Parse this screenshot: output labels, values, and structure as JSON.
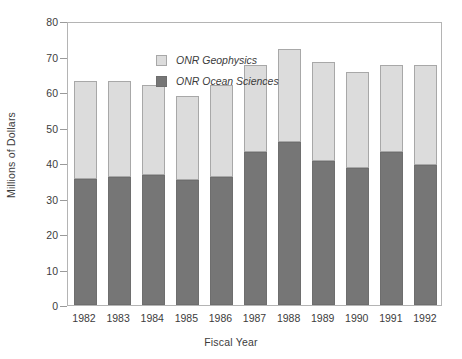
{
  "chart_data": {
    "type": "bar",
    "stacked": true,
    "title": "",
    "xlabel": "Fiscal Year",
    "ylabel": "Millions of Dollars",
    "categories": [
      "1982",
      "1983",
      "1984",
      "1985",
      "1986",
      "1987",
      "1988",
      "1989",
      "1990",
      "1991",
      "1992"
    ],
    "series": [
      {
        "name": "ONR Ocean Sciences",
        "color": "#767676",
        "values": [
          35.5,
          36,
          36.5,
          35.3,
          36,
          43,
          46,
          40.5,
          38.5,
          43,
          39.5
        ]
      },
      {
        "name": "ONR Geophysics",
        "color": "#dcdcdc",
        "values": [
          27.5,
          27,
          25.5,
          23.7,
          26,
          24.5,
          26,
          28,
          27,
          24.5,
          28
        ]
      }
    ],
    "totals": [
      63,
      63,
      62,
      59,
      62,
      67.5,
      72,
      68.5,
      65.5,
      67.5,
      67.5
    ],
    "ylim": [
      0,
      80
    ],
    "yticks": [
      0,
      10,
      20,
      30,
      40,
      50,
      60,
      70,
      80
    ],
    "ytick_labels": [
      "0",
      "10",
      "20",
      "30",
      "40",
      "50",
      "60",
      "70",
      "80"
    ],
    "grid": false,
    "legend_position": "top-left",
    "legend_entries": [
      "ONR Geophysics",
      "ONR Ocean Sciences"
    ]
  },
  "axes": {
    "y_title": "Millions of Dollars",
    "x_title": "Fiscal Year"
  },
  "legend": {
    "entries": [
      {
        "label": "ONR Geophysics",
        "swatch": "light"
      },
      {
        "label": "ONR Ocean Sciences",
        "swatch": "dark"
      }
    ]
  }
}
